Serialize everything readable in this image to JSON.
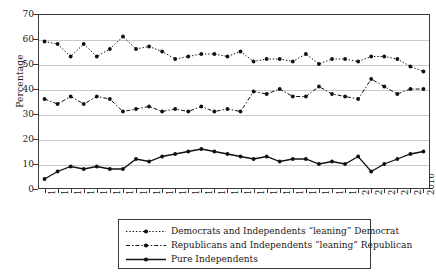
{
  "chart_data": {
    "type": "line",
    "title": "",
    "xlabel": "",
    "ylabel": "Percentage",
    "ylim": [
      0,
      70
    ],
    "ytick_step": 10,
    "yticks": [
      0,
      10,
      20,
      30,
      40,
      50,
      60,
      70
    ],
    "grid": true,
    "legend_position": "bottom",
    "categories": [
      "1952",
      "1954",
      "1956",
      "1958",
      "1960",
      "1962",
      "1964",
      "1966",
      "1968",
      "1970",
      "1972",
      "1974",
      "1976",
      "1978",
      "1980",
      "1982",
      "1984",
      "1986",
      "1988",
      "1990",
      "1992",
      "1994",
      "1996",
      "1998",
      "2000",
      "2002",
      "2004",
      "2008",
      "2012",
      "2016"
    ],
    "series": [
      {
        "name": "Democrats and Independents “leaning” Democrat",
        "style": "dotted",
        "values": [
          59,
          58,
          53,
          58,
          53,
          56,
          61,
          56,
          57,
          55,
          52,
          53,
          54,
          54,
          53,
          55,
          51,
          52,
          52,
          51,
          54,
          50,
          52,
          52,
          51,
          53,
          53,
          52,
          49,
          47
        ]
      },
      {
        "name": "Republicans and Independents “leaning” Republican",
        "style": "dash-dot",
        "values": [
          36,
          34,
          37,
          34,
          37,
          36,
          31,
          32,
          33,
          31,
          32,
          31,
          33,
          31,
          32,
          31,
          39,
          38,
          40,
          37,
          37,
          41,
          38,
          37,
          36,
          44,
          41,
          38,
          40,
          40
        ]
      },
      {
        "name": "Pure Independents",
        "style": "solid",
        "values": [
          4,
          7,
          9,
          8,
          9,
          8,
          8,
          12,
          11,
          13,
          14,
          15,
          16,
          15,
          14,
          13,
          12,
          13,
          11,
          12,
          12,
          10,
          11,
          10,
          13,
          7,
          10,
          12,
          14,
          15
        ]
      }
    ]
  },
  "legend": {
    "entries": [
      {
        "label": "Democrats and Independents “leaning” Democrat",
        "key": "dotted-line-marker-key"
      },
      {
        "label": "Republicans and Independents “leaning” Republican",
        "key": "dash-dot-line-marker-key"
      },
      {
        "label": "Pure Independents",
        "key": "solid-line-marker-key"
      }
    ]
  },
  "colors": {
    "ink": "#111111",
    "grid": "#c9c9c9",
    "axis": "#3a3a3a",
    "background": "#ffffff"
  }
}
